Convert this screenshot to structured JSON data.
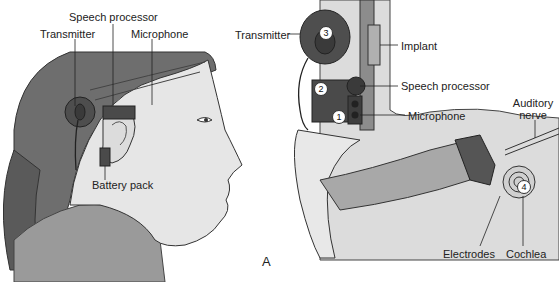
{
  "figure": {
    "panel_letter": "A",
    "left_panel": {
      "labels": {
        "speech_processor": "Speech processor",
        "transmitter": "Transmitter",
        "microphone": "Microphone",
        "battery_pack": "Battery pack"
      }
    },
    "right_panel": {
      "labels": {
        "transmitter": "Transmitter",
        "implant": "Implant",
        "speech_processor": "Speech processor",
        "microphone": "Microphone",
        "auditory_nerve_line1": "Auditory",
        "auditory_nerve_line2": "nerve",
        "electrodes": "Electrodes",
        "cochlea": "Cochlea"
      },
      "numbers": [
        "1",
        "2",
        "3",
        "4"
      ]
    },
    "colors": {
      "hair": "#6e6e6e",
      "skin": "#e6e6e6",
      "shirt": "#9a9a9a",
      "device": "#4a4a4a",
      "bone": "#d8d8d8",
      "canal": "#a8a8a8"
    }
  }
}
